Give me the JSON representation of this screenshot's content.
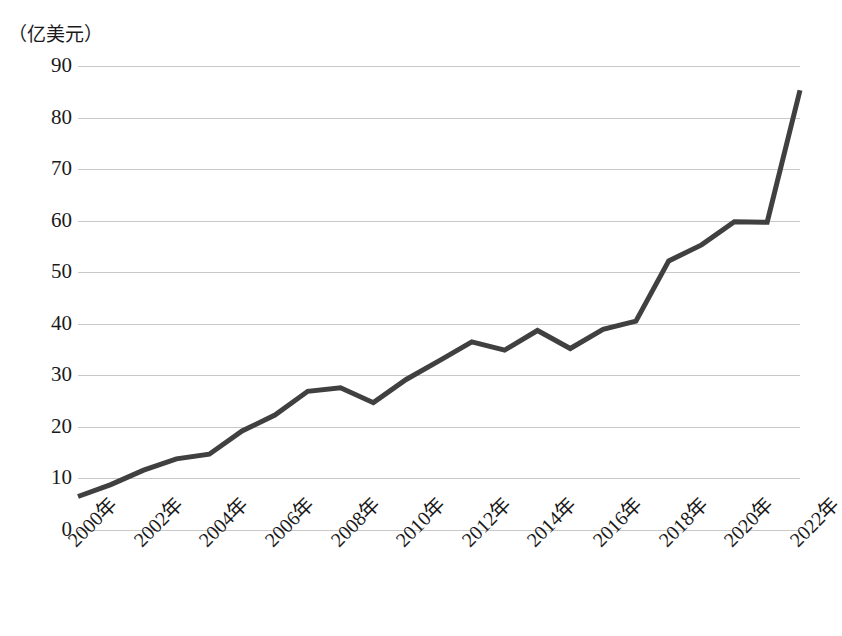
{
  "chart_data": {
    "type": "line",
    "title": "",
    "subtitle": "",
    "unit_label": "（亿美元）",
    "xlabel": "",
    "ylabel": "",
    "x": [
      "2000年",
      "2001年",
      "2002年",
      "2003年",
      "2004年",
      "2005年",
      "2006年",
      "2007年",
      "2008年",
      "2009年",
      "2010年",
      "2011年",
      "2012年",
      "2013年",
      "2014年",
      "2015年",
      "2016年",
      "2017年",
      "2018年",
      "2019年",
      "2020年",
      "2021年",
      "2022年"
    ],
    "x_tick_labels": [
      "2000年",
      "2002年",
      "2004年",
      "2006年",
      "2008年",
      "2010年",
      "2012年",
      "2014年",
      "2016年",
      "2018年",
      "2020年",
      "2022年"
    ],
    "values": [
      6.5,
      8.8,
      11.6,
      13.8,
      14.7,
      19.2,
      22.3,
      26.9,
      27.6,
      24.7,
      29.2,
      32.8,
      36.5,
      34.9,
      38.7,
      35.2,
      38.9,
      40.5,
      52.2,
      55.3,
      59.8,
      59.7,
      85.3
    ],
    "y_tick_labels": [
      "0",
      "10",
      "20",
      "30",
      "40",
      "50",
      "60",
      "70",
      "80",
      "90"
    ],
    "y_ticks": [
      0,
      10,
      20,
      30,
      40,
      50,
      60,
      70,
      80,
      90
    ],
    "ylim": [
      0,
      90
    ],
    "grid": true,
    "legend": "none",
    "series_color": "#404040",
    "gridline_color": "#c8c8c8",
    "background_color": "#ffffff",
    "markers": false,
    "line_width": 5
  }
}
